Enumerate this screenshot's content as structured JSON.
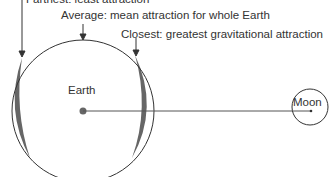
{
  "labels": {
    "farthest": "Farthest: least attraction",
    "average": "Average: mean attraction for whole Earth",
    "closest": "Closest: greatest gravitational attraction",
    "earth": "Earth",
    "moon": "Moon"
  },
  "colors": {
    "line": "#333333",
    "bulge": "#666666",
    "background": "#ffffff"
  }
}
